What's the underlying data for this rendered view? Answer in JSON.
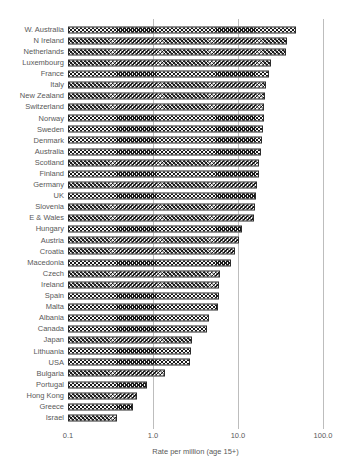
{
  "chart_data": {
    "type": "bar",
    "orientation": "horizontal",
    "title": "",
    "xlabel": "Rate per million (age 15+)",
    "xscale": "log",
    "xlim": [
      0.1,
      100.0
    ],
    "xticks": [
      {
        "label": "0.1",
        "value": 0.1
      },
      {
        "label": "1.0",
        "value": 1.0
      },
      {
        "label": "10.0",
        "value": 10.0
      },
      {
        "label": "100.0",
        "value": 100.0
      }
    ],
    "gridlines_at": [
      1.0,
      10.0,
      100.0
    ],
    "grid_on": true,
    "legend": "none",
    "categories": [
      "W. Australia",
      "N Ireland",
      "Netherlands",
      "Luxembourg",
      "France",
      "Italy",
      "New Zealand",
      "Switzerland",
      "Norway",
      "Sweden",
      "Denmark",
      "Australia",
      "Scotland",
      "Finland",
      "Germany",
      "UK",
      "Slovenia",
      "E & Wales",
      "Hungary",
      "Austria",
      "Croatia",
      "Macedonia",
      "Czech",
      "Ireland",
      "Spain",
      "Malta",
      "Albania",
      "Canada",
      "Japan",
      "Lithuania",
      "USA",
      "Bulgaria",
      "Portugal",
      "Hong Kong",
      "Greece",
      "Israel"
    ],
    "values": [
      48,
      38,
      37,
      24.5,
      23,
      21.5,
      21,
      20.5,
      20,
      19.5,
      19,
      18.5,
      17.8,
      17.5,
      16.8,
      16.2,
      16,
      15.5,
      11,
      10.3,
      9.3,
      8.2,
      6.2,
      6.0,
      5.9,
      5.8,
      4.5,
      4.3,
      2.9,
      2.8,
      2.7,
      1.4,
      0.85,
      0.65,
      0.58,
      0.38
    ],
    "bar_pattern": "diagonal-crosshatch",
    "colors": {
      "background": "#ffffff",
      "text": "#595959",
      "grid": "#bdbdbd",
      "bar_outline": "#2b2b2b",
      "bar_hatch": "#1a1a1a"
    }
  }
}
